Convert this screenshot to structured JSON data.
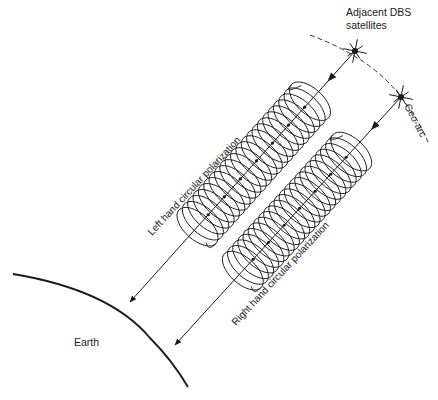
{
  "figure": {
    "top_cropped_text": "",
    "labels": {
      "satellites_line1": "Adjacent DBS",
      "satellites_line2": "satellites",
      "geo_arc": "Geo-arc",
      "left_beam": "Left hand circular polarization",
      "right_beam": "Right hand circular polarization",
      "earth": "Earth"
    },
    "beams": [
      {
        "name": "left-hand",
        "polarization": "left hand circular",
        "coils": 22
      },
      {
        "name": "right-hand",
        "polarization": "right hand circular",
        "coils": 22
      }
    ],
    "satellites_count": 2,
    "colors": {
      "ink": "#1a1a1a",
      "background": "#ffffff"
    }
  }
}
